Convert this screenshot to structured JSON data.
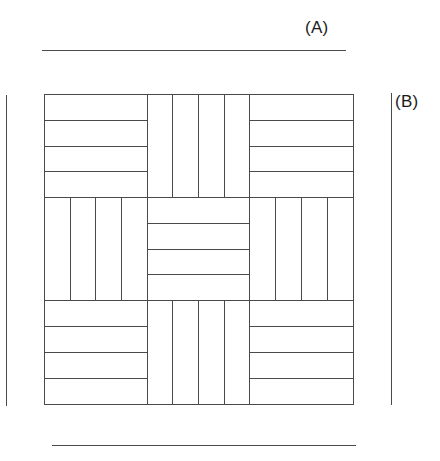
{
  "figure": {
    "title": "",
    "background_color": "#ffffff",
    "line_color": "#4a4a4a",
    "text_color": "#1a1a1a"
  },
  "labels": {
    "a": "(A)",
    "b": "(B)"
  },
  "rules": {
    "top": {
      "name": "top-dimension-rule"
    },
    "bottom": {
      "name": "bottom-dimension-rule"
    },
    "left": {
      "name": "left-dimension-rule"
    },
    "right": {
      "name": "right-dimension-rule"
    }
  },
  "parquet": {
    "rows": 3,
    "columns": 3,
    "strips_per_block": 4,
    "blocks": [
      {
        "row": 0,
        "col": 0,
        "orientation": "horizontal",
        "strips": 4
      },
      {
        "row": 0,
        "col": 1,
        "orientation": "vertical",
        "strips": 4
      },
      {
        "row": 0,
        "col": 2,
        "orientation": "horizontal",
        "strips": 4
      },
      {
        "row": 1,
        "col": 0,
        "orientation": "vertical",
        "strips": 4
      },
      {
        "row": 1,
        "col": 1,
        "orientation": "horizontal",
        "strips": 4
      },
      {
        "row": 1,
        "col": 2,
        "orientation": "vertical",
        "strips": 4
      },
      {
        "row": 2,
        "col": 0,
        "orientation": "horizontal",
        "strips": 4
      },
      {
        "row": 2,
        "col": 1,
        "orientation": "vertical",
        "strips": 4
      },
      {
        "row": 2,
        "col": 2,
        "orientation": "horizontal",
        "strips": 4
      }
    ]
  }
}
